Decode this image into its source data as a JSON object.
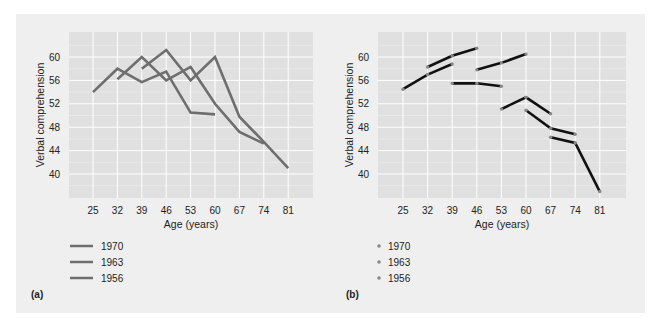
{
  "chart_data": [
    {
      "panel": "(a)",
      "type": "line",
      "xlabel": "Age (years)",
      "ylabel": "Verbal comprehension",
      "x_ticks": [
        25,
        32,
        39,
        46,
        53,
        60,
        67,
        74,
        81
      ],
      "y_ticks": [
        40,
        44,
        48,
        52,
        56,
        60
      ],
      "xlim": [
        20,
        88
      ],
      "ylim": [
        36,
        64
      ],
      "grid": true,
      "legend_position": "bottom-left",
      "series": [
        {
          "name": "1970",
          "points": [
            [
              39,
              58
            ],
            [
              46,
              61.2
            ],
            [
              53,
              56
            ],
            [
              60,
              60
            ],
            [
              67,
              49.8
            ],
            [
              74,
              45.5
            ],
            [
              81,
              41
            ]
          ]
        },
        {
          "name": "1963",
          "points": [
            [
              32,
              56.2
            ],
            [
              39,
              60
            ],
            [
              46,
              56
            ],
            [
              53,
              58.3
            ],
            [
              60,
              52
            ],
            [
              67,
              47.2
            ],
            [
              74,
              45.2
            ]
          ]
        },
        {
          "name": "1956",
          "points": [
            [
              25,
              54
            ],
            [
              32,
              58
            ],
            [
              39,
              55.7
            ],
            [
              46,
              57.5
            ],
            [
              53,
              50.5
            ],
            [
              60,
              50.2
            ]
          ]
        }
      ]
    },
    {
      "panel": "(b)",
      "type": "line",
      "xlabel": "Age (years)",
      "ylabel": "Verbal comprehension",
      "x_ticks": [
        25,
        32,
        39,
        46,
        53,
        60,
        67,
        74,
        81
      ],
      "y_ticks": [
        40,
        44,
        48,
        52,
        56,
        60
      ],
      "xlim": [
        20,
        88
      ],
      "ylim": [
        36,
        64
      ],
      "grid": true,
      "legend_position": "bottom-left",
      "legend_entries": [
        "1970",
        "1963",
        "1956"
      ],
      "segments": [
        {
          "points": [
            [
              25,
              54.5
            ],
            [
              32,
              57
            ],
            [
              39,
              58.8
            ]
          ]
        },
        {
          "points": [
            [
              32,
              58.3
            ],
            [
              39,
              60.2
            ],
            [
              46,
              61.5
            ]
          ]
        },
        {
          "points": [
            [
              39,
              55.5
            ],
            [
              46,
              55.5
            ],
            [
              53,
              55
            ]
          ]
        },
        {
          "points": [
            [
              46,
              57.8
            ],
            [
              53,
              59
            ],
            [
              60,
              60.5
            ]
          ]
        },
        {
          "points": [
            [
              53,
              51.1
            ],
            [
              60,
              53.1
            ],
            [
              67,
              50.3
            ]
          ]
        },
        {
          "points": [
            [
              60,
              50.9
            ],
            [
              67,
              47.8
            ],
            [
              74,
              46.8
            ]
          ]
        },
        {
          "points": [
            [
              67,
              46.3
            ],
            [
              74,
              45.3
            ],
            [
              81,
              37
            ]
          ]
        }
      ]
    }
  ],
  "charts": {
    "a": {
      "label": "(a)",
      "xlabel": "Age (years)",
      "ylabel": "Verbal comprehension",
      "legend": [
        "1970",
        "1963",
        "1956"
      ]
    },
    "b": {
      "label": "(b)",
      "xlabel": "Age (years)",
      "ylabel": "Verbal comprehension",
      "legend": [
        "1970",
        "1963",
        "1956"
      ]
    }
  },
  "colors": {
    "panel_bg": "#efefef",
    "plot_bg": "#e0e0e0",
    "grid": "#ffffff",
    "line_a": "#6e6e6e",
    "line_b": "#111111",
    "marker_b": "#8a8a8a"
  }
}
